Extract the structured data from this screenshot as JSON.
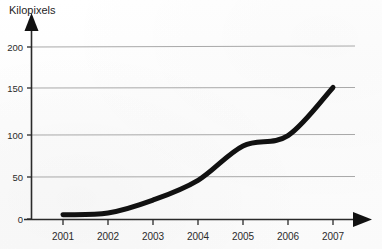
{
  "figure": {
    "background_color": "#fdfdfd",
    "axis_color": "#1a1a1a",
    "grid_color": "#a8a8a8",
    "series_color": "#111111"
  },
  "chart_data": {
    "type": "line",
    "title": "",
    "ylabel": "Kilopixels",
    "xlabel": "",
    "categories": [
      "2001",
      "2002",
      "2003",
      "2004",
      "2005",
      "2006",
      "2007"
    ],
    "x": [
      2001,
      2002,
      2003,
      2004,
      2005,
      2006,
      2007
    ],
    "values": [
      5,
      7,
      22,
      45,
      85,
      97,
      153
    ],
    "series": [
      {
        "name": "Kilopixels",
        "values": [
          5,
          7,
          22,
          45,
          85,
          97,
          153
        ]
      }
    ],
    "ylim": [
      0,
      215
    ],
    "xlim": [
      2000.6,
      2007.6
    ],
    "yticks": [
      0,
      50,
      100,
      150,
      200
    ],
    "ytick_labels": [
      "0",
      "50",
      "100",
      "150",
      "200"
    ],
    "xtick_labels": [
      "2001",
      "2002",
      "2003",
      "2004",
      "2005",
      "2006",
      "2007"
    ],
    "grid": "horizontal",
    "legend": "none",
    "axis_arrows": true,
    "line_width_px": 5,
    "annotations": []
  },
  "axes": {
    "y_label": "Kilopixels",
    "y_ticks": [
      "200",
      "150",
      "100",
      "50",
      "0"
    ],
    "x_ticks": [
      "2001",
      "2002",
      "2003",
      "2004",
      "2005",
      "2006",
      "2007"
    ]
  },
  "icons": {
    "y_axis_arrow": "arrow-up-icon",
    "x_axis_arrow": "arrow-right-icon"
  }
}
